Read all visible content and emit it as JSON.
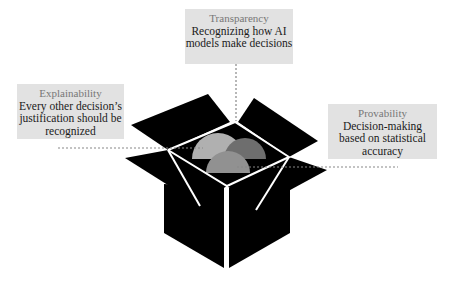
{
  "diagram": {
    "labels": {
      "transparency": {
        "title": "Transparency",
        "body_line1": "Recognizing how AI",
        "body_line2": "models make decisions"
      },
      "explainability": {
        "title": "Explainability",
        "body_line1": "Every other decision’s",
        "body_line2": "justification should be",
        "body_line3": "recognized"
      },
      "provability": {
        "title": "Provability",
        "body_line1": "Decision-making",
        "body_line2": "based on statistical",
        "body_line3": "accuracy"
      }
    },
    "colors": {
      "box": "#000000",
      "box_edges": "#ffffff",
      "label_bg": "#e2e2e2",
      "label_title": "#777777",
      "label_body": "#1a1a1a",
      "dotted_line": "#888888",
      "semicircle_light": "#b0b0b0",
      "semicircle_dark": "#6e6e6e",
      "semicircle_mid": "#919191"
    }
  }
}
